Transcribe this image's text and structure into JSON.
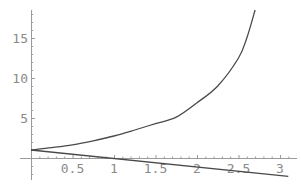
{
  "chart_data": {
    "type": "line",
    "title": "",
    "xlabel": "",
    "ylabel": "",
    "xlim": [
      0,
      3.1
    ],
    "ylim": [
      -3,
      18.5
    ],
    "grid": false,
    "legend": null,
    "x_ticks": [
      0.5,
      1,
      1.5,
      2,
      2.5,
      3
    ],
    "x_tick_labels": [
      "0.5",
      "1",
      "1.5",
      "2",
      "2.5",
      "3"
    ],
    "y_ticks": [
      5,
      10,
      15
    ],
    "y_tick_labels": [
      "5",
      "10",
      "15"
    ],
    "series": [
      {
        "name": "growing-curve",
        "x": [
          0,
          0.25,
          0.5,
          0.75,
          1,
          1.25,
          1.5,
          1.75,
          2,
          2.25,
          2.5,
          2.6,
          2.7
        ],
        "y": [
          1,
          1.3,
          1.65,
          2.15,
          2.75,
          3.5,
          4.3,
          5.1,
          6.9,
          9.0,
          12.5,
          15.0,
          18.5
        ]
      },
      {
        "name": "decreasing-line",
        "x": [
          0,
          3.1
        ],
        "y": [
          1,
          -2.3
        ]
      }
    ]
  },
  "colors": {
    "axis": "#9a9a9a",
    "curve": "#4a4a4a",
    "tick_label": "#8a8a8a"
  }
}
